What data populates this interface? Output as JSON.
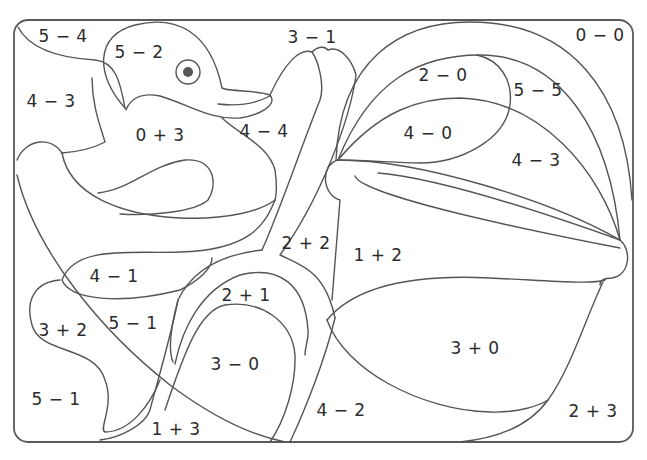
{
  "page": {
    "colors": {
      "line": "#555555",
      "background": "#ffffff",
      "text": "#2b2b2b",
      "eye": "#555555"
    }
  },
  "regions": [
    {
      "id": "r1",
      "expr": "5 − 4",
      "x": 63,
      "y": 36
    },
    {
      "id": "r2",
      "expr": "5 − 2",
      "x": 139,
      "y": 52
    },
    {
      "id": "r3",
      "expr": "3 − 1",
      "x": 312,
      "y": 37
    },
    {
      "id": "r4",
      "expr": "0 − 0",
      "x": 600,
      "y": 35
    },
    {
      "id": "r5",
      "expr": "4 − 3",
      "x": 51,
      "y": 101
    },
    {
      "id": "r6",
      "expr": "2 − 0",
      "x": 443,
      "y": 75
    },
    {
      "id": "r7",
      "expr": "5 − 5",
      "x": 538,
      "y": 90
    },
    {
      "id": "r8",
      "expr": "0 + 3",
      "x": 160,
      "y": 135
    },
    {
      "id": "r9",
      "expr": "4 − 4",
      "x": 264,
      "y": 131
    },
    {
      "id": "r10",
      "expr": "4 − 0",
      "x": 428,
      "y": 133
    },
    {
      "id": "r11",
      "expr": "4 − 3",
      "x": 536,
      "y": 160
    },
    {
      "id": "r12",
      "expr": "2 + 2",
      "x": 306,
      "y": 243
    },
    {
      "id": "r13",
      "expr": "1 + 2",
      "x": 378,
      "y": 255
    },
    {
      "id": "r14",
      "expr": "4 − 1",
      "x": 114,
      "y": 276
    },
    {
      "id": "r15",
      "expr": "2 + 1",
      "x": 246,
      "y": 295
    },
    {
      "id": "r16",
      "expr": "3 + 2",
      "x": 63,
      "y": 330
    },
    {
      "id": "r17",
      "expr": "5 − 1",
      "x": 133,
      "y": 323
    },
    {
      "id": "r18",
      "expr": "3 + 0",
      "x": 475,
      "y": 348
    },
    {
      "id": "r19",
      "expr": "3 − 0",
      "x": 235,
      "y": 364
    },
    {
      "id": "r20",
      "expr": "5 − 1",
      "x": 56,
      "y": 399
    },
    {
      "id": "r21",
      "expr": "4 − 2",
      "x": 341,
      "y": 410
    },
    {
      "id": "r22",
      "expr": "2 + 3",
      "x": 593,
      "y": 411
    },
    {
      "id": "r23",
      "expr": "1 + 3",
      "x": 176,
      "y": 429
    }
  ]
}
